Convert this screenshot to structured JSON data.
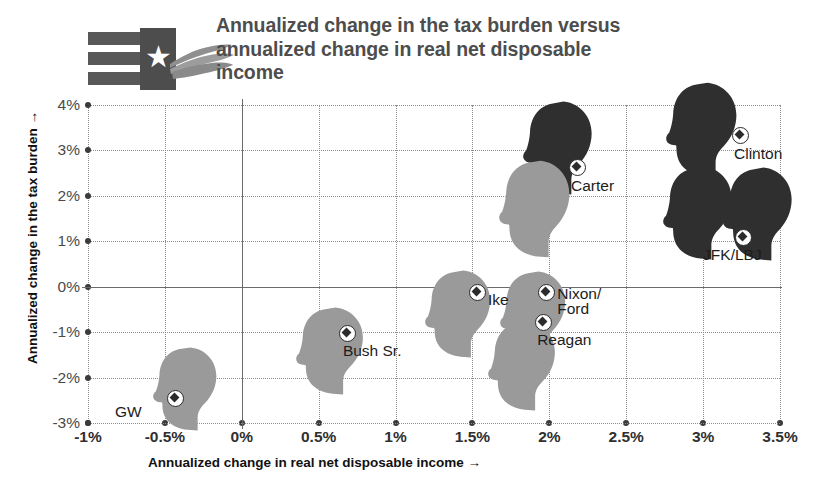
{
  "header": {
    "title": "Annualized change in the tax burden versus annualized change in real net disposable income",
    "logo_name": "flag-and-hand-logo",
    "logo_star": "★"
  },
  "chart_data": {
    "type": "scatter",
    "title": "Annualized change in the tax burden versus annualized change in real net disposable income",
    "xlabel": "Annualized change in real net disposable income →",
    "ylabel": "Annualized change in the tax burden →",
    "xlim": [
      -1,
      3.5
    ],
    "ylim": [
      -3,
      4
    ],
    "xticks": [
      "-1%",
      "-0.5%",
      "0%",
      "0.5%",
      "1%",
      "1.5%",
      "2%",
      "2.5%",
      "3%",
      "3.5%"
    ],
    "xtick_values": [
      -1,
      -0.5,
      0,
      0.5,
      1,
      1.5,
      2,
      2.5,
      3,
      3.5
    ],
    "yticks": [
      "4%",
      "3%",
      "2%",
      "1%",
      "0%",
      "-1%",
      "-2%",
      "-3%"
    ],
    "ytick_values": [
      4,
      3,
      2,
      1,
      0,
      -1,
      -2,
      -3
    ],
    "grid": true,
    "legend": "none",
    "marker_style": "ringed-diamond",
    "point_glyph": "presidential-head-silhouette",
    "party_colors": {
      "republican": "#9a9a9a",
      "democrat": "#2f2f2f"
    },
    "points": [
      {
        "label": "GW",
        "x": -0.43,
        "y": -2.45,
        "party": "republican"
      },
      {
        "label": "Bush Sr.",
        "x": 0.69,
        "y": -1.02,
        "party": "republican"
      },
      {
        "label": "Ike",
        "x": 1.53,
        "y": -0.12,
        "party": "republican"
      },
      {
        "label": "Nixon/Ford",
        "x": 1.98,
        "y": -0.12,
        "party": "republican"
      },
      {
        "label": "Reagan",
        "x": 1.96,
        "y": -0.78,
        "party": "republican"
      },
      {
        "label": "Carter",
        "x": 2.18,
        "y": 2.62,
        "party": "democrat"
      },
      {
        "label": "Clinton",
        "x": 3.24,
        "y": 3.32,
        "party": "democrat"
      },
      {
        "label": "JFK/LBJ",
        "x": 3.26,
        "y": 1.08,
        "party": "democrat"
      }
    ]
  }
}
